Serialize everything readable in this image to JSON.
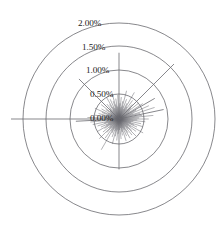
{
  "chart_data": {
    "type": "line",
    "subtype": "polar-radial-burst",
    "title": "",
    "xlabel": "",
    "ylabel": "",
    "units": "percent",
    "center": {
      "x": 119,
      "y": 119
    },
    "grid": {
      "on": true,
      "shape": "circle",
      "color": "#55555a",
      "radial_ticks": [
        {
          "label": "0.00%",
          "value": 0.0,
          "radius_px": 0,
          "label_x": 90,
          "label_y": 121
        },
        {
          "label": "0.50%",
          "value": 0.5,
          "radius_px": 25,
          "label_x": 90,
          "label_y": 97
        },
        {
          "label": "1.00%",
          "value": 1.0,
          "radius_px": 49,
          "label_x": 86,
          "label_y": 73
        },
        {
          "label": "1.50%",
          "value": 1.5,
          "radius_px": 73,
          "label_x": 82,
          "label_y": 50
        },
        {
          "label": "2.00%",
          "value": 2.0,
          "radius_px": 96,
          "label_x": 78,
          "label_y": 26
        }
      ]
    },
    "rlim": [
      0.0,
      2.0
    ],
    "legend": {
      "show": false,
      "position": "none"
    },
    "series": [
      {
        "name": "radial-magnitudes",
        "color": "#6a6a70",
        "angle_unit": "degrees",
        "note": "angle measured clockwise from east (0deg = right)",
        "points": [
          {
            "angle": 0,
            "value": 0.62
          },
          {
            "angle": 3,
            "value": 0.38
          },
          {
            "angle": 6,
            "value": 0.55
          },
          {
            "angle": 9,
            "value": 0.3
          },
          {
            "angle": 12,
            "value": 0.47
          },
          {
            "angle": 15,
            "value": 0.26
          },
          {
            "angle": 18,
            "value": 0.52
          },
          {
            "angle": 21,
            "value": 0.33
          },
          {
            "angle": 24,
            "value": 0.41
          },
          {
            "angle": 27,
            "value": 0.22
          },
          {
            "angle": 30,
            "value": 0.58
          },
          {
            "angle": 33,
            "value": 0.29
          },
          {
            "angle": 36,
            "value": 0.44
          },
          {
            "angle": 39,
            "value": 0.24
          },
          {
            "angle": 42,
            "value": 0.36
          },
          {
            "angle": 45,
            "value": 0.5
          },
          {
            "angle": 48,
            "value": 0.27
          },
          {
            "angle": 51,
            "value": 0.43
          },
          {
            "angle": 54,
            "value": 0.2
          },
          {
            "angle": 57,
            "value": 0.34
          },
          {
            "angle": 60,
            "value": 0.46
          },
          {
            "angle": 63,
            "value": 0.25
          },
          {
            "angle": 66,
            "value": 0.39
          },
          {
            "angle": 69,
            "value": 0.21
          },
          {
            "angle": 72,
            "value": 0.48
          },
          {
            "angle": 75,
            "value": 0.28
          },
          {
            "angle": 78,
            "value": 0.35
          },
          {
            "angle": 81,
            "value": 0.19
          },
          {
            "angle": 84,
            "value": 0.42
          },
          {
            "angle": 87,
            "value": 0.23
          },
          {
            "angle": 90,
            "value": 1.05
          },
          {
            "angle": 93,
            "value": 0.31
          },
          {
            "angle": 96,
            "value": 0.45
          },
          {
            "angle": 99,
            "value": 0.24
          },
          {
            "angle": 102,
            "value": 0.37
          },
          {
            "angle": 105,
            "value": 0.54
          },
          {
            "angle": 108,
            "value": 0.26
          },
          {
            "angle": 111,
            "value": 0.4
          },
          {
            "angle": 114,
            "value": 0.22
          },
          {
            "angle": 117,
            "value": 0.33
          },
          {
            "angle": 120,
            "value": 0.74
          },
          {
            "angle": 123,
            "value": 0.29
          },
          {
            "angle": 126,
            "value": 0.49
          },
          {
            "angle": 129,
            "value": 0.25
          },
          {
            "angle": 132,
            "value": 0.38
          },
          {
            "angle": 135,
            "value": 0.58
          },
          {
            "angle": 138,
            "value": 0.27
          },
          {
            "angle": 141,
            "value": 0.43
          },
          {
            "angle": 144,
            "value": 0.23
          },
          {
            "angle": 147,
            "value": 0.36
          },
          {
            "angle": 150,
            "value": 0.52
          },
          {
            "angle": 153,
            "value": 0.3
          },
          {
            "angle": 156,
            "value": 0.41
          },
          {
            "angle": 159,
            "value": 0.24
          },
          {
            "angle": 162,
            "value": 0.47
          },
          {
            "angle": 165,
            "value": 0.32
          },
          {
            "angle": 168,
            "value": 0.56
          },
          {
            "angle": 171,
            "value": 0.28
          },
          {
            "angle": 174,
            "value": 0.6
          },
          {
            "angle": 177,
            "value": 0.9
          },
          {
            "angle": 180,
            "value": 2.25
          },
          {
            "angle": 183,
            "value": 0.66
          },
          {
            "angle": 186,
            "value": 0.35
          },
          {
            "angle": 189,
            "value": 0.51
          },
          {
            "angle": 192,
            "value": 0.27
          },
          {
            "angle": 195,
            "value": 0.44
          },
          {
            "angle": 198,
            "value": 0.23
          },
          {
            "angle": 201,
            "value": 0.38
          },
          {
            "angle": 204,
            "value": 0.55
          },
          {
            "angle": 207,
            "value": 0.26
          },
          {
            "angle": 210,
            "value": 0.42
          },
          {
            "angle": 213,
            "value": 0.21
          },
          {
            "angle": 216,
            "value": 0.34
          },
          {
            "angle": 219,
            "value": 0.48
          },
          {
            "angle": 222,
            "value": 0.25
          },
          {
            "angle": 225,
            "value": 1.18
          },
          {
            "angle": 228,
            "value": 0.29
          },
          {
            "angle": 231,
            "value": 0.4
          },
          {
            "angle": 234,
            "value": 0.22
          },
          {
            "angle": 237,
            "value": 0.36
          },
          {
            "angle": 240,
            "value": 0.53
          },
          {
            "angle": 243,
            "value": 0.28
          },
          {
            "angle": 246,
            "value": 0.45
          },
          {
            "angle": 249,
            "value": 0.24
          },
          {
            "angle": 252,
            "value": 0.39
          },
          {
            "angle": 255,
            "value": 0.57
          },
          {
            "angle": 258,
            "value": 0.31
          },
          {
            "angle": 261,
            "value": 0.43
          },
          {
            "angle": 264,
            "value": 0.26
          },
          {
            "angle": 267,
            "value": 0.5
          },
          {
            "angle": 270,
            "value": 1.38
          },
          {
            "angle": 273,
            "value": 0.33
          },
          {
            "angle": 276,
            "value": 0.46
          },
          {
            "angle": 279,
            "value": 0.25
          },
          {
            "angle": 282,
            "value": 0.38
          },
          {
            "angle": 285,
            "value": 0.61
          },
          {
            "angle": 288,
            "value": 0.29
          },
          {
            "angle": 291,
            "value": 0.44
          },
          {
            "angle": 294,
            "value": 0.23
          },
          {
            "angle": 297,
            "value": 0.37
          },
          {
            "angle": 300,
            "value": 0.64
          },
          {
            "angle": 303,
            "value": 0.3
          },
          {
            "angle": 306,
            "value": 0.48
          },
          {
            "angle": 309,
            "value": 0.26
          },
          {
            "angle": 312,
            "value": 0.41
          },
          {
            "angle": 315,
            "value": 1.62
          },
          {
            "angle": 318,
            "value": 0.34
          },
          {
            "angle": 321,
            "value": 0.52
          },
          {
            "angle": 324,
            "value": 0.27
          },
          {
            "angle": 327,
            "value": 0.59
          },
          {
            "angle": 330,
            "value": 0.86
          },
          {
            "angle": 333,
            "value": 0.4
          },
          {
            "angle": 336,
            "value": 0.68
          },
          {
            "angle": 339,
            "value": 0.32
          },
          {
            "angle": 342,
            "value": 0.78
          },
          {
            "angle": 345,
            "value": 0.45
          },
          {
            "angle": 348,
            "value": 0.95
          },
          {
            "angle": 351,
            "value": 0.49
          },
          {
            "angle": 354,
            "value": 0.72
          },
          {
            "angle": 357,
            "value": 0.42
          }
        ]
      }
    ]
  }
}
